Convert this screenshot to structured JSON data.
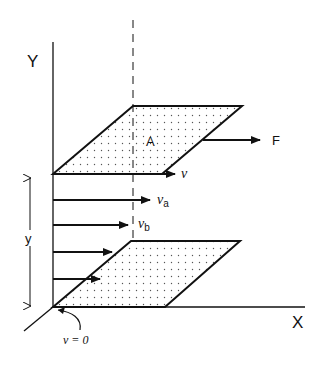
{
  "diagram": {
    "type": "shear-flow between parallel plates",
    "axes": {
      "y_label": "Y",
      "x_label": "X"
    },
    "top_plate": {
      "area_label": "A",
      "force_label": "F",
      "velocity_label": "v"
    },
    "velocity_profile": [
      {
        "label": "v",
        "sub": ""
      },
      {
        "label": "v",
        "sub": "a"
      },
      {
        "label": "v",
        "sub": "b"
      },
      {
        "label": "",
        "sub": ""
      },
      {
        "label": "",
        "sub": ""
      }
    ],
    "bottom_plate": {
      "boundary_label": "v = 0"
    },
    "separation_label": "y",
    "colors": {
      "line": "#111111",
      "background": "#ffffff",
      "dots": "#555555"
    }
  }
}
